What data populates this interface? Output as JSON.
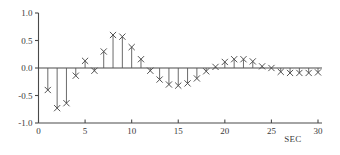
{
  "chart_data": {
    "type": "bar",
    "subtype": "stem",
    "title": "",
    "subtitle": "",
    "xlabel": "SEC",
    "ylabel": "",
    "xlim": [
      0,
      30
    ],
    "ylim": [
      -1.0,
      1.0
    ],
    "grid": false,
    "legend": null,
    "marker": "x",
    "baseline": 0.0,
    "xticks": [
      0,
      5,
      10,
      15,
      20,
      25,
      30
    ],
    "xtick_labels": [
      "0",
      "5",
      "10",
      "15",
      "20",
      "25",
      "30"
    ],
    "yticks": [
      -1.0,
      -0.5,
      0.0,
      0.5,
      1.0
    ],
    "ytick_labels": [
      "-1.0",
      "-0.5",
      "0.0",
      "0.5",
      "1.0"
    ],
    "x": [
      1,
      2,
      3,
      4,
      5,
      6,
      7,
      8,
      9,
      10,
      11,
      12,
      13,
      14,
      15,
      16,
      17,
      18,
      19,
      20,
      21,
      22,
      23,
      24,
      25,
      26,
      27,
      28,
      29,
      30
    ],
    "values": [
      -0.4,
      -0.73,
      -0.64,
      -0.14,
      0.13,
      -0.05,
      0.3,
      0.6,
      0.57,
      0.38,
      0.16,
      -0.05,
      -0.21,
      -0.3,
      -0.32,
      -0.28,
      -0.19,
      -0.06,
      0.02,
      0.11,
      0.16,
      0.16,
      0.12,
      0.03,
      0.0,
      -0.07,
      -0.09,
      -0.09,
      -0.09,
      -0.08
    ],
    "colors": {
      "axis": "#4a4a4a",
      "stem": "#5a5a5a",
      "marker": "#4a4a4a",
      "text": "#3a3a3a",
      "background": "#ffffff"
    }
  },
  "axis_caption": {
    "x_unit_label": "SEC"
  }
}
